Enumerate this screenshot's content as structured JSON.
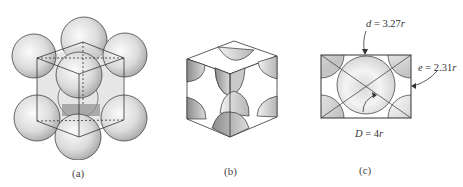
{
  "figure": {
    "panels": [
      {
        "id": "a",
        "caption": "(a)",
        "description": "Face-centered cubic unit cell with atoms as full hard spheres"
      },
      {
        "id": "b",
        "caption": "(b)",
        "description": "Reduced-sphere unit cell showing atom fractions within the cube"
      },
      {
        "id": "c",
        "caption": "(c)",
        "description": "Cube face cross-section with dimension labels"
      }
    ],
    "labels": {
      "d": {
        "symbol": "d",
        "eq": " = ",
        "value": "3.27",
        "unit": "r"
      },
      "e": {
        "symbol": "e",
        "eq": " = ",
        "value": "2.31",
        "unit": "r"
      },
      "D": {
        "symbol": "D",
        "eq": " = ",
        "value": "4",
        "unit": "r"
      }
    },
    "colors": {
      "line": "#3a3a3a",
      "sphere_light": "#f4f4f4",
      "sphere_dark": "#9a9a9a",
      "face_shade": "#cfcfcf"
    }
  }
}
